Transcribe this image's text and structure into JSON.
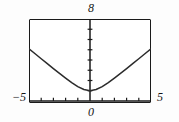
{
  "figure": {
    "background_color": "#fdfdfd",
    "frame_color": "#1a1a1a",
    "curve_color": "#2b2b2b"
  },
  "labels": {
    "top": "8",
    "bottom": "0",
    "left": "−5",
    "right": "5"
  },
  "chart_data": {
    "type": "line",
    "title": "",
    "xlabel": "",
    "ylabel": "",
    "xlim": [
      -5,
      5
    ],
    "ylim": [
      0,
      8
    ],
    "grid": false,
    "legend": null,
    "axis_ticks": {
      "x_tick_values": [
        -4,
        -3,
        -2,
        -1,
        1,
        2,
        3,
        4
      ],
      "y_tick_values": [
        1,
        2,
        3,
        4,
        5,
        6,
        7
      ],
      "x_labeled_ticks": [
        {
          "value": -5,
          "label": "−5"
        },
        {
          "value": 0,
          "label": "0"
        },
        {
          "value": 5,
          "label": "5"
        }
      ],
      "y_labeled_ticks": [
        {
          "value": 8,
          "label": "8"
        }
      ]
    },
    "series": [
      {
        "name": "curve",
        "x": [
          -5.0,
          -4.5,
          -4.0,
          -3.5,
          -3.0,
          -2.5,
          -2.0,
          -1.5,
          -1.0,
          -0.5,
          0.0,
          0.5,
          1.0,
          1.5,
          2.0,
          2.5,
          3.0,
          3.5,
          4.0,
          4.5,
          5.0
        ],
        "y": [
          5.1,
          4.61,
          4.12,
          3.64,
          3.16,
          2.69,
          2.24,
          1.8,
          1.41,
          1.12,
          1.0,
          1.12,
          1.41,
          1.8,
          2.24,
          2.69,
          3.16,
          3.64,
          4.12,
          4.61,
          5.1
        ]
      }
    ]
  }
}
